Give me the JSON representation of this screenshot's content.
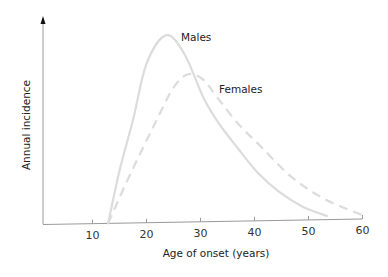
{
  "chart_data": {
    "type": "line",
    "title": "",
    "xlabel": "Age of onset (years)",
    "ylabel": "Annual incidence",
    "xlim": [
      0,
      60
    ],
    "ylim": [
      0,
      100
    ],
    "x_ticks": [
      10,
      20,
      30,
      40,
      50,
      60
    ],
    "y_ticks": [],
    "grid": false,
    "legend": "inline labels next to curves",
    "series": [
      {
        "name": "Males",
        "style": "solid",
        "color": "#dcdcdc",
        "x": [
          12.9,
          15,
          17.5,
          20,
          23.6,
          27,
          30.6,
          33.5,
          36.9,
          40.5,
          44.7,
          49,
          53.4
        ],
        "y": [
          0,
          28,
          55,
          85,
          100,
          90,
          66,
          52,
          39,
          26,
          15,
          7,
          2
        ]
      },
      {
        "name": "Females",
        "style": "dashed",
        "color": "#dcdcdc",
        "x": [
          12.9,
          16,
          19,
          21.9,
          25,
          27.7,
          30.5,
          33.2,
          37,
          41.4,
          46.9,
          53,
          60
        ],
        "y": [
          0,
          20,
          38,
          55,
          72,
          79,
          76,
          66,
          52,
          39,
          23,
          11,
          2
        ]
      }
    ]
  },
  "labels": {
    "xlabel": "Age of onset (years)",
    "ylabel": "Annual incidence",
    "males": "Males",
    "females": "Females",
    "ticks": [
      "10",
      "20",
      "30",
      "40",
      "50",
      "60"
    ]
  },
  "colors": {
    "axis": "#8a8a8a",
    "arrow": "#111111",
    "curve": "#dcdcdc",
    "text": "#222222"
  }
}
